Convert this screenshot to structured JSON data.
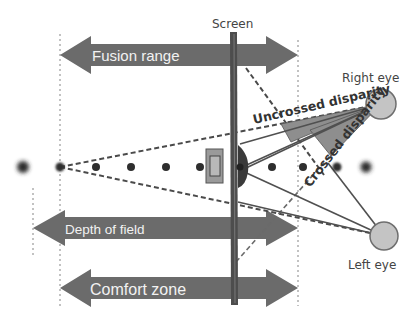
{
  "diagram": {
    "labels": {
      "screen": "Screen",
      "right_eye": "Right eye",
      "left_eye": "Left eye",
      "uncrossed_disparity": "Uncrossed disparity",
      "crossed_disparity": "Crossed disparity"
    },
    "ranges": [
      {
        "id": "fusion-range",
        "label": "Fusion range"
      },
      {
        "id": "depth-of-field",
        "label": "Depth of field"
      },
      {
        "id": "comfort-zone",
        "label": "Comfort zone"
      }
    ],
    "colors": {
      "arrow": "#6b6b6b",
      "eye_fill": "#c4c4c4",
      "eye_stroke": "#6e6e6e",
      "disparity_fill": "#8e8e8e",
      "line": "#4a4a4a",
      "dot": "#2e2e2e",
      "screen": "#4d4d4d"
    }
  }
}
